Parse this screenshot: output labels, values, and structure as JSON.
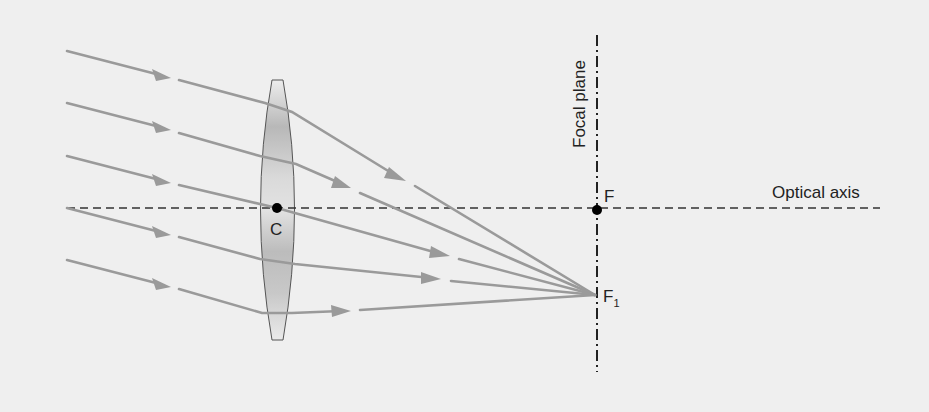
{
  "diagram": {
    "labels": {
      "lens_center": "C",
      "focal_point": "F",
      "off_axis_focus": "F",
      "off_axis_focus_subscript": "1",
      "focal_plane": "Focal plane",
      "optical_axis": "Optical axis"
    },
    "colors": {
      "background": "#efefef",
      "ray": "#9a9a9a",
      "axis_line": "#333333",
      "lens_fill_light": "#e6e6e6",
      "lens_fill_dark": "#b0b0b0",
      "lens_outline": "#555555",
      "point": "#000000"
    },
    "geometry": {
      "optical_axis_y": 208,
      "optical_axis_x": [
        67,
        880
      ],
      "focal_plane_x": 597,
      "focal_plane_y": [
        35,
        372
      ],
      "lens_center": [
        277,
        208
      ],
      "focal_point": [
        597,
        210
      ],
      "off_axis_focus": [
        595,
        295
      ]
    },
    "rays": [
      {
        "id": 1,
        "incoming": [
          [
            67,
            51
          ],
          [
            171,
            78
          ]
        ],
        "in_lens": [
          [
            179,
            80
          ],
          [
            265,
            103
          ],
          [
            292,
            112
          ]
        ],
        "outgoing": [
          [
            292,
            112
          ],
          [
            405,
            181
          ]
        ],
        "final": [
          [
            415,
            186
          ],
          [
            595,
            295
          ]
        ]
      },
      {
        "id": 2,
        "incoming": [
          [
            67,
            103
          ],
          [
            171,
            130
          ]
        ],
        "in_lens": [
          [
            179,
            133
          ],
          [
            260,
            156
          ],
          [
            296,
            164
          ]
        ],
        "outgoing": [
          [
            296,
            164
          ],
          [
            350,
            188
          ]
        ],
        "final": [
          [
            360,
            193
          ],
          [
            595,
            295
          ]
        ]
      },
      {
        "id": 3,
        "incoming": [
          [
            67,
            156
          ],
          [
            171,
            183
          ]
        ],
        "in_lens": [
          [
            179,
            185
          ],
          [
            277,
            208
          ]
        ],
        "outgoing": [
          [
            277,
            208
          ],
          [
            449,
            256
          ]
        ],
        "final": [
          [
            459,
            259
          ],
          [
            595,
            295
          ]
        ]
      },
      {
        "id": 4,
        "incoming": [
          [
            67,
            208
          ],
          [
            171,
            235
          ]
        ],
        "in_lens": [
          [
            179,
            237
          ],
          [
            260,
            259
          ],
          [
            295,
            264
          ]
        ],
        "outgoing": [
          [
            295,
            264
          ],
          [
            440,
            279
          ]
        ],
        "final": [
          [
            451,
            281
          ],
          [
            595,
            295
          ]
        ]
      },
      {
        "id": 5,
        "incoming": [
          [
            67,
            260
          ],
          [
            171,
            287
          ]
        ],
        "in_lens": [
          [
            179,
            289
          ],
          [
            262,
            313
          ],
          [
            292,
            313
          ]
        ],
        "outgoing": [
          [
            292,
            313
          ],
          [
            350,
            311
          ]
        ],
        "final": [
          [
            360,
            310
          ],
          [
            595,
            295
          ]
        ]
      }
    ]
  }
}
